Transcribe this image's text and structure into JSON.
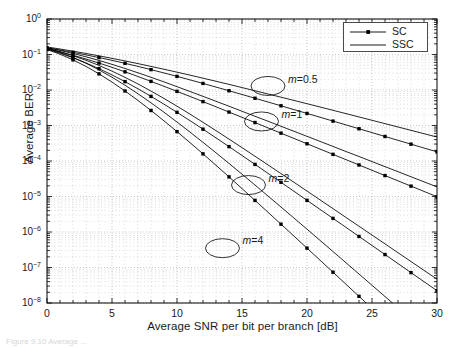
{
  "figure": {
    "caption": "Figure 9.10  Average ...",
    "legend": {
      "position": "top-right",
      "entries": [
        {
          "label": "SC",
          "marker": true
        },
        {
          "label": "SSC",
          "marker": false
        }
      ]
    }
  },
  "chart_data": {
    "type": "line",
    "title": "",
    "xlabel": "Average SNR per bit per branch [dB]",
    "ylabel": "Average BER",
    "xlim": [
      0,
      30
    ],
    "ylim": [
      1e-08,
      1
    ],
    "yscale": "log",
    "xticks": [
      "0",
      "5",
      "10",
      "15",
      "20",
      "25",
      "30"
    ],
    "yticks": [
      "10<sup>0</sup>",
      "10<sup>-1</sup>",
      "10<sup>-2</sup>",
      "10<sup>-3</sup>",
      "10<sup>-4</sup>",
      "10<sup>-5</sup>",
      "10<sup>-6</sup>",
      "10<sup>-7</sup>",
      "10<sup>-8</sup>"
    ],
    "ytick_values": [
      1,
      0.1,
      0.01,
      0.001,
      0.0001,
      1e-05,
      1e-06,
      1e-07,
      1e-08
    ],
    "grid": "both-minor-log",
    "legend_position": "upper right",
    "annotations": [
      {
        "text": "m=0.5",
        "italic_prefix": "m",
        "rest": "=0.5",
        "x": 17.0,
        "y": 0.013,
        "ellipse": true
      },
      {
        "text": "m=1",
        "italic_prefix": "m",
        "rest": "=1",
        "x": 16.5,
        "y": 0.0013,
        "ellipse": true
      },
      {
        "text": "m=2",
        "italic_prefix": "m",
        "rest": "=2",
        "x": 15.5,
        "y": 2.1e-05,
        "ellipse": true
      },
      {
        "text": "m=4",
        "italic_prefix": "m",
        "rest": "=4",
        "x": 13.5,
        "y": 3.5e-07,
        "ellipse": true
      }
    ],
    "x": [
      0,
      1,
      2,
      3,
      4,
      5,
      6,
      7,
      8,
      9,
      10,
      11,
      12,
      13,
      14,
      15,
      16,
      17,
      18,
      19,
      20,
      21,
      22,
      23,
      24,
      25,
      26,
      27,
      28,
      29,
      30
    ],
    "series": [
      {
        "name": "SC m=0.5",
        "scheme": "SC",
        "m": 0.5,
        "marker": true,
        "values": [
          0.155,
          0.134,
          0.115,
          0.0975,
          0.082,
          0.0685,
          0.0565,
          0.0462,
          0.0375,
          0.0302,
          0.0242,
          0.0193,
          0.0153,
          0.0121,
          0.00952,
          0.00748,
          0.00586,
          0.00459,
          0.00359,
          0.0028,
          0.00219,
          0.00171,
          0.00133,
          0.00104,
          0.000809,
          0.000631,
          0.000491,
          0.000383,
          0.000298,
          0.000232,
          0.000181
        ]
      },
      {
        "name": "SSC m=0.5",
        "scheme": "SSC",
        "m": 0.5,
        "marker": false,
        "values": [
          0.163,
          0.143,
          0.124,
          0.107,
          0.0915,
          0.0779,
          0.0658,
          0.0553,
          0.0462,
          0.0384,
          0.0318,
          0.0262,
          0.0215,
          0.0176,
          0.0144,
          0.0117,
          0.00952,
          0.00773,
          0.00627,
          0.00508,
          0.00411,
          0.00332,
          0.00268,
          0.00216,
          0.00174,
          0.0014,
          0.00113,
          0.000909,
          0.000731,
          0.000588,
          0.000473
        ]
      },
      {
        "name": "SC m=1",
        "scheme": "SC",
        "m": 1,
        "marker": true,
        "values": [
          0.146,
          0.119,
          0.0951,
          0.0746,
          0.0574,
          0.0435,
          0.0325,
          0.024,
          0.0175,
          0.0127,
          0.00916,
          0.00658,
          0.00471,
          0.00336,
          0.00239,
          0.0017,
          0.00121,
          0.000857,
          0.000608,
          0.000431,
          0.000306,
          0.000217,
          0.000154,
          0.000109,
          7.73e-05,
          5.48e-05,
          3.89e-05,
          2.76e-05,
          1.96e-05,
          1.39e-05,
          9.85e-06
        ]
      },
      {
        "name": "SSC m=1",
        "scheme": "SSC",
        "m": 1,
        "marker": false,
        "values": [
          0.155,
          0.13,
          0.107,
          0.0861,
          0.068,
          0.0528,
          0.0404,
          0.0305,
          0.0228,
          0.0169,
          0.0124,
          0.00908,
          0.00662,
          0.00481,
          0.00349,
          0.00252,
          0.00182,
          0.00132,
          0.000951,
          0.000686,
          0.000495,
          0.000357,
          0.000257,
          0.000185,
          0.000134,
          9.63e-05,
          6.94e-05,
          5e-05,
          3.6e-05,
          2.59e-05,
          1.87e-05
        ]
      },
      {
        "name": "SC m=2",
        "scheme": "SC",
        "m": 2,
        "marker": true,
        "values": [
          0.141,
          0.109,
          0.0807,
          0.0578,
          0.0399,
          0.0266,
          0.0172,
          0.0108,
          0.00662,
          0.00398,
          0.00235,
          0.00137,
          0.000788,
          0.000449,
          0.000254,
          0.000143,
          8.03e-05,
          4.49e-05,
          2.51e-05,
          1.4e-05,
          7.8e-06,
          4.34e-06,
          2.42e-06,
          1.35e-06,
          7.5e-07,
          4.17e-07,
          2.32e-07,
          1.29e-07,
          7.18e-08,
          3.99e-08,
          2.22e-08
        ]
      },
      {
        "name": "SSC m=2",
        "scheme": "SSC",
        "m": 2,
        "marker": false,
        "values": [
          0.15,
          0.12,
          0.0925,
          0.0688,
          0.0492,
          0.034,
          0.0227,
          0.0148,
          0.00933,
          0.00577,
          0.0035,
          0.00209,
          0.00123,
          0.000716,
          0.000414,
          0.000238,
          0.000136,
          7.76e-05,
          4.42e-05,
          2.51e-05,
          1.42e-05,
          8.05e-06,
          4.55e-06,
          2.57e-06,
          1.45e-06,
          8.2e-07,
          4.63e-07,
          2.61e-07,
          1.47e-07,
          8.31e-08,
          4.69e-08
        ]
      },
      {
        "name": "SC m=4",
        "scheme": "SC",
        "m": 4,
        "marker": true,
        "values": [
          0.138,
          0.102,
          0.0706,
          0.0461,
          0.0285,
          0.0167,
          0.00938,
          0.00507,
          0.00265,
          0.00135,
          0.000673,
          0.000329,
          0.000159,
          7.57e-05,
          3.57e-05,
          1.67e-05,
          7.77e-06,
          3.6e-06,
          1.66e-06,
          7.64e-07,
          3.51e-07,
          1.61e-07,
          7.37e-08,
          3.37e-08,
          1.54e-08,
          7.04e-09,
          3.2e-09,
          1.46e-09,
          6.6e-10,
          3e-10,
          1.4e-10
        ]
      },
      {
        "name": "SSC m=4",
        "scheme": "SSC",
        "m": 4,
        "marker": false,
        "values": [
          0.148,
          0.114,
          0.0827,
          0.0567,
          0.0369,
          0.0229,
          0.0136,
          0.00782,
          0.00435,
          0.00236,
          0.00125,
          0.000652,
          0.000335,
          0.00017,
          8.53e-05,
          4.25e-05,
          2.1e-05,
          1.03e-05,
          5.05e-06,
          2.46e-06,
          1.2e-06,
          5.81e-07,
          2.81e-07,
          1.36e-07,
          6.55e-08,
          3.16e-08,
          1.52e-08,
          7.33e-09,
          3.53e-09,
          1.7e-09,
          8.2e-10
        ]
      }
    ]
  }
}
